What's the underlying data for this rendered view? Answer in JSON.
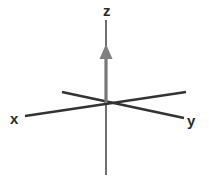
{
  "figure": {
    "background_color": "#ffffff",
    "width": 209,
    "height": 182
  },
  "labels": {
    "z": "z",
    "x": "x",
    "y": "y"
  },
  "colors": {
    "axis_line": "#333333",
    "z_shaft": "#777777",
    "z_arrowhead": "#808080",
    "label": "#2b2b2b"
  },
  "chart_data": {
    "type": "diagram",
    "subtype": "3d-axis-frame",
    "title": "",
    "origin": {
      "x": 105,
      "y": 103
    },
    "axes": [
      {
        "name": "z",
        "label": "z",
        "label_position": {
          "x": 103,
          "y": 3
        },
        "direction": "up",
        "has_arrowhead": true,
        "arrowhead_color": "#808080",
        "arrowhead_tip": {
          "x": 106,
          "y": 44
        },
        "arrowhead_base": {
          "x": 106,
          "y": 59
        },
        "segments": [
          {
            "from": {
              "x": 106,
              "y": 20
            },
            "to": {
              "x": 106,
              "y": 46
            },
            "color": "#333333",
            "width": 1.4
          },
          {
            "from": {
              "x": 106,
              "y": 56
            },
            "to": {
              "x": 106,
              "y": 103
            },
            "color": "#777777",
            "width": 3.2
          },
          {
            "from": {
              "x": 106,
              "y": 103
            },
            "to": {
              "x": 106,
              "y": 175
            },
            "color": "#333333",
            "width": 1.4
          }
        ]
      },
      {
        "name": "x",
        "label": "x",
        "label_position": {
          "x": 10,
          "y": 111
        },
        "direction": "lower-left",
        "has_arrowhead": false,
        "segments": [
          {
            "from": {
              "x": 25,
              "y": 116
            },
            "to": {
              "x": 186,
              "y": 92
            },
            "color": "#333333",
            "width": 2.6
          }
        ]
      },
      {
        "name": "y",
        "label": "y",
        "label_position": {
          "x": 187,
          "y": 113
        },
        "direction": "lower-right",
        "has_arrowhead": false,
        "segments": [
          {
            "from": {
              "x": 62,
              "y": 92
            },
            "to": {
              "x": 184,
              "y": 118
            },
            "color": "#333333",
            "width": 2.6
          }
        ]
      }
    ],
    "grid": false,
    "legend": null,
    "annotations": []
  }
}
